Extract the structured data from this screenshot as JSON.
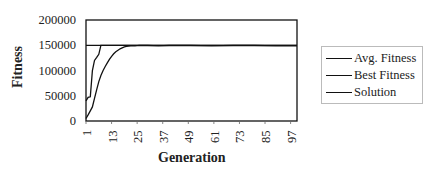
{
  "chart_data": {
    "type": "line",
    "title": "",
    "xlabel": "Generation",
    "ylabel": "Fitness",
    "ylim": [
      0,
      200000
    ],
    "xlim": [
      1,
      100
    ],
    "y_ticks": [
      "200000",
      "150000",
      "100000",
      "50000",
      "0"
    ],
    "x_ticks": [
      "1",
      "13",
      "25",
      "37",
      "49",
      "61",
      "73",
      "85",
      "97"
    ],
    "grid": false,
    "legend_position": "right",
    "series": [
      {
        "name": "Avg. Fitness",
        "x": [
          1,
          2,
          3,
          4,
          5,
          6,
          7,
          8,
          9,
          10,
          11,
          12,
          13,
          14,
          15,
          16,
          17,
          18,
          19,
          20,
          22,
          24,
          26,
          30,
          35,
          40,
          50,
          60,
          70,
          80,
          90,
          100
        ],
        "y": [
          5000,
          12000,
          20000,
          28000,
          45000,
          62000,
          78000,
          90000,
          100000,
          108000,
          115000,
          122000,
          128000,
          133000,
          137000,
          140000,
          143000,
          145000,
          147000,
          148000,
          149000,
          149000,
          150000,
          149500,
          149000,
          149500,
          149500,
          149000,
          149500,
          149500,
          149000,
          149000
        ]
      },
      {
        "name": "Best Fitness",
        "x": [
          1,
          2,
          3,
          4,
          5,
          6,
          7,
          8,
          9,
          100
        ],
        "y": [
          40000,
          47000,
          48000,
          100000,
          120000,
          126000,
          132000,
          150000,
          150000,
          150000
        ]
      },
      {
        "name": "Solution",
        "x": [
          1,
          100
        ],
        "y": [
          150000,
          150000
        ]
      }
    ]
  }
}
